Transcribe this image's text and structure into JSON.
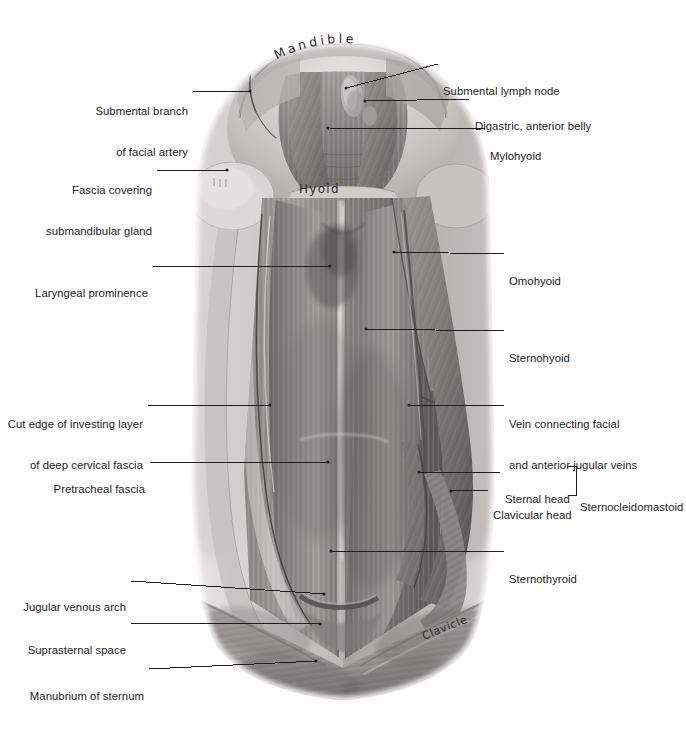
{
  "plate": {
    "title": "Anterior triangle of the neck — superficial dissection",
    "background_color": "#ffffff",
    "label_color": "#1b1b1b",
    "leader_color": "#1d1d1d"
  },
  "labels_left": [
    {
      "id": "submental-branch-of-facial-artery",
      "lines": [
        "Submental branch",
        "of facial artery"
      ],
      "text_right": 188,
      "text_top": 78,
      "leader": {
        "x1": 193,
        "x2": 252,
        "y": 91
      },
      "dot": {
        "x": 250,
        "y": 91
      }
    },
    {
      "id": "fascia-covering-submandibular-gland",
      "lines": [
        "Fascia covering",
        "submandibular gland"
      ],
      "text_right": 152,
      "text_top": 157,
      "leader": {
        "x1": 157,
        "x2": 228,
        "y": 170
      },
      "dot": {
        "x": 227,
        "y": 170
      }
    },
    {
      "id": "laryngeal-prominence",
      "lines": [
        "Laryngeal prominence"
      ],
      "text_right": 148,
      "text_top": 260,
      "leader": {
        "x1": 153,
        "x2": 332,
        "y": 266
      },
      "dot": {
        "x": 330,
        "y": 266
      }
    },
    {
      "id": "cut-edge-of-investing-layer-of-deep-cervical-fascia",
      "lines": [
        "Cut edge of investing layer",
        "of deep cervical fascia"
      ],
      "text_right": 143,
      "text_top": 391,
      "leader": {
        "x1": 148,
        "x2": 272,
        "y": 405
      },
      "dot": {
        "x": 270,
        "y": 405
      }
    },
    {
      "id": "pretracheal-fascia",
      "lines": [
        "Pretracheal fascia"
      ],
      "text_right": 145,
      "text_top": 456,
      "leader": {
        "x1": 150,
        "x2": 330,
        "y": 462
      },
      "dot": {
        "x": 328,
        "y": 462
      }
    },
    {
      "id": "jugular-venous-arch",
      "lines": [
        "Jugular venous arch"
      ],
      "text_right": 126,
      "text_top": 574,
      "leader": {
        "x1": 131,
        "x2": 326,
        "y": 581,
        "slope_to_y": 594
      },
      "dot": {
        "x": 324,
        "y": 594
      }
    },
    {
      "id": "suprasternal-space",
      "lines": [
        "Suprasternal space"
      ],
      "text_right": 126,
      "text_top": 617,
      "leader": {
        "x1": 131,
        "x2": 322,
        "y": 623,
        "slope_to_y": 624
      },
      "dot": {
        "x": 320,
        "y": 624
      }
    },
    {
      "id": "manubrium-of-sternum",
      "lines": [
        "Manubrium of sternum"
      ],
      "text_right": 144,
      "text_top": 663,
      "leader": {
        "x1": 149,
        "x2": 318,
        "y": 669,
        "slope_to_y": 661
      },
      "dot": {
        "x": 316,
        "y": 661
      }
    }
  ],
  "labels_right": [
    {
      "id": "submental-lymph-node",
      "lines": [
        "Submental lymph node"
      ],
      "text_left": 443,
      "text_top": 58,
      "leader": {
        "x1": 345,
        "x2": 438,
        "y1": 88,
        "y2": 64
      },
      "dot": {
        "x": 346,
        "y": 88
      }
    },
    {
      "id": "digastric-anterior-belly",
      "lines": [
        "Digastric, anterior belly"
      ],
      "text_left": 475,
      "text_top": 93,
      "leader": {
        "x1": 364,
        "x2": 470,
        "y1": 101,
        "y2": 99
      },
      "dot": {
        "x": 365,
        "y": 101
      }
    },
    {
      "id": "mylohyoid",
      "lines": [
        "Mylohyoid"
      ],
      "text_left": 490,
      "text_top": 123,
      "leader": {
        "x1": 327,
        "x2": 485,
        "y1": 128,
        "y2": 129
      },
      "dot": {
        "x": 328,
        "y": 128
      }
    },
    {
      "id": "omohyoid",
      "lines": [
        "Omohyoid"
      ],
      "text_left": 509,
      "text_top": 248,
      "leader": {
        "x1": 393,
        "x2": 504,
        "y1": 252,
        "y2": 254
      },
      "dot": {
        "x": 394,
        "y": 252
      }
    },
    {
      "id": "sternohyoid",
      "lines": [
        "Sternohyoid"
      ],
      "text_left": 509,
      "text_top": 325,
      "leader": {
        "x1": 365,
        "x2": 504,
        "y1": 329,
        "y2": 331
      },
      "dot": {
        "x": 366,
        "y": 329
      }
    },
    {
      "id": "vein-connecting-facial-and-anterior-jugular-veins",
      "lines": [
        "Vein connecting facial",
        "and anterior jugular veins"
      ],
      "text_left": 509,
      "text_top": 391,
      "leader": {
        "x1": 408,
        "x2": 504,
        "y1": 405,
        "y2": 405
      },
      "dot": {
        "x": 409,
        "y": 405
      }
    },
    {
      "id": "sternal-head",
      "lines": [
        "Sternal head"
      ],
      "text_left": 505,
      "text_top": 468,
      "text_align": "right",
      "text_width": 60,
      "leader": {
        "x1": 418,
        "x2": 500,
        "y1": 472,
        "y2": 473
      },
      "dot": {
        "x": 419,
        "y": 472
      }
    },
    {
      "id": "clavicular-head",
      "lines": [
        "Clavicular head"
      ],
      "text_left": 493,
      "text_top": 485,
      "text_align": "right",
      "text_width": 72,
      "leader": {
        "x1": 450,
        "x2": 489,
        "y1": 491,
        "y2": 490
      },
      "dot": {
        "x": 451,
        "y": 491
      }
    },
    {
      "id": "sternocleidomastoid",
      "lines": [
        "Sternocleidomastoid"
      ],
      "text_left": 580,
      "text_top": 476
    },
    {
      "id": "sternothyroid",
      "lines": [
        "Sternothyroid"
      ],
      "text_left": 509,
      "text_top": 546,
      "leader": {
        "x1": 330,
        "x2": 504,
        "y1": 551,
        "y2": 551
      },
      "dot": {
        "x": 331,
        "y": 551
      }
    }
  ],
  "bracket": {
    "id": "sternocleidomastoid-bracket",
    "left": 568,
    "top": 466,
    "height": 28
  },
  "handwritten": [
    {
      "id": "mandible",
      "text": "Mandible",
      "left": 266,
      "top": 31,
      "arc": true
    },
    {
      "id": "hyoid",
      "text": "Hyoid",
      "left": 298,
      "top": 177,
      "arc": false
    },
    {
      "id": "clavicle",
      "text": "Clavicle",
      "left": 425,
      "top": 622,
      "arc": false,
      "rotate": -22
    }
  ]
}
